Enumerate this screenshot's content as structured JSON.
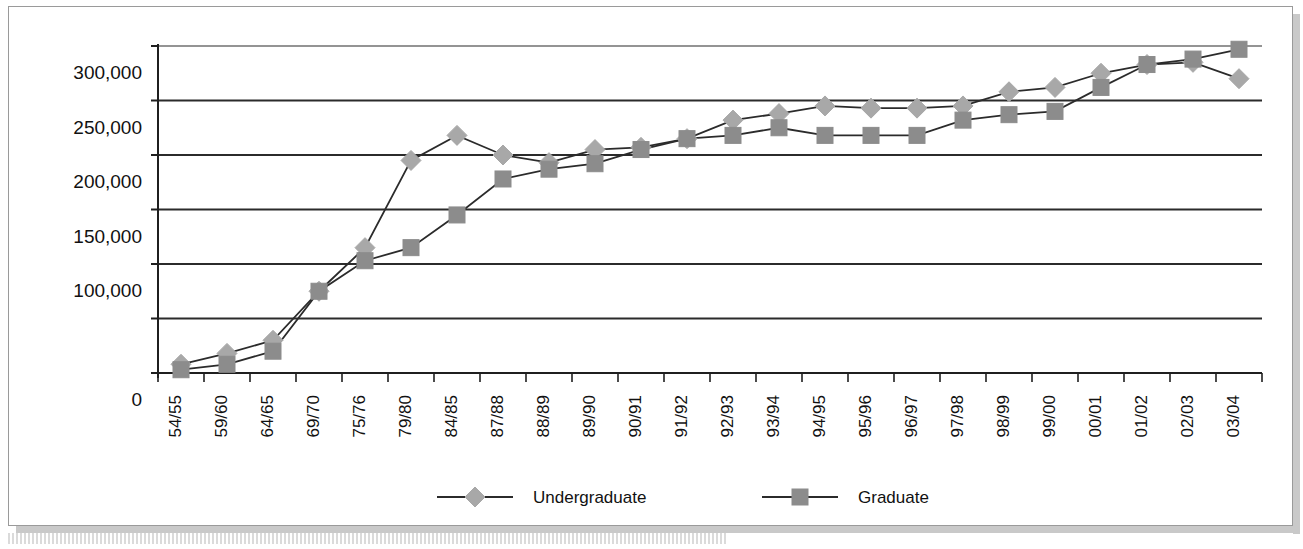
{
  "chart_data": {
    "type": "line",
    "title": "",
    "xlabel": "",
    "ylabel": "",
    "ylim": [
      0,
      300000
    ],
    "ytick_values": [
      300000,
      250000,
      200000,
      150000,
      100000,
      50000,
      0
    ],
    "ytick_labels": [
      "300,000",
      "250,000",
      "200,000",
      "150,000",
      "100,000",
      "",
      "0"
    ],
    "grid": true,
    "legend_position": "bottom",
    "categories": [
      "54/55",
      "59/60",
      "64/65",
      "69/70",
      "75/76",
      "79/80",
      "84/85",
      "87/88",
      "88/89",
      "89/90",
      "90/91",
      "91/92",
      "92/93",
      "93/94",
      "94/95",
      "95/96",
      "96/97",
      "97/98",
      "98/99",
      "99/00",
      "00/01",
      "01/02",
      "02/03",
      "03/04"
    ],
    "series": [
      {
        "name": "Undergraduate",
        "marker": "diamond",
        "color": "#a8a8a8",
        "line_color": "#2b2b2b",
        "values": [
          8000,
          18000,
          30000,
          75000,
          115000,
          195000,
          218000,
          200000,
          193000,
          205000,
          207000,
          215000,
          232000,
          238000,
          245000,
          243000,
          243000,
          245000,
          258000,
          262000,
          275000,
          283000,
          285000,
          270000
        ]
      },
      {
        "name": "Graduate",
        "marker": "square",
        "color": "#8c8c8c",
        "line_color": "#2b2b2b",
        "values": [
          3000,
          8000,
          20000,
          75000,
          103000,
          115000,
          145000,
          178000,
          187000,
          192000,
          205000,
          215000,
          218000,
          225000,
          218000,
          218000,
          218000,
          232000,
          237000,
          240000,
          262000,
          283000,
          288000,
          297000
        ]
      }
    ]
  },
  "legend": {
    "items": [
      {
        "label": "Undergraduate"
      },
      {
        "label": "Graduate"
      }
    ]
  },
  "colors": {
    "axis": "#1f1f1f",
    "gridline": "#2b2b2b",
    "frame": "#9a9a9a",
    "undergraduate_marker": "#a8a8a8",
    "graduate_marker": "#8c8c8c",
    "background": "#ffffff"
  }
}
